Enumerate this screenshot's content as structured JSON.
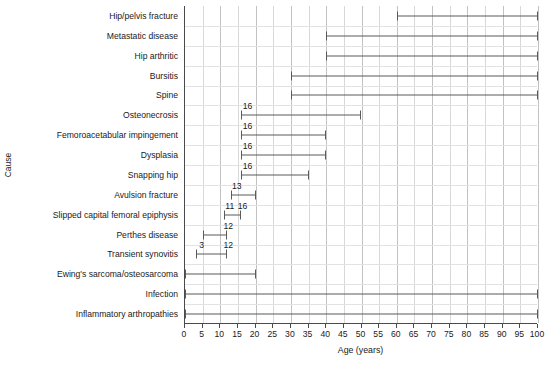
{
  "chart_data": {
    "type": "bar",
    "subtype": "range-bar",
    "title": "",
    "xlabel": "Age (years)",
    "ylabel": "Cause",
    "xlim": [
      0,
      100
    ],
    "xticks": [
      0,
      5,
      10,
      15,
      20,
      25,
      30,
      35,
      40,
      45,
      50,
      55,
      60,
      65,
      70,
      75,
      80,
      85,
      90,
      95,
      100
    ],
    "xtick_labels": [
      "0",
      "5",
      "10",
      "15",
      "20",
      "25",
      "30",
      "35",
      "40",
      "45",
      "50",
      "55",
      "60",
      "65",
      "70",
      "75",
      "80",
      "85",
      "90",
      "95",
      "100"
    ],
    "grid": true,
    "legend": false,
    "bar_color": "#5a5a5a",
    "categories": [
      "Hip/pelvis fracture",
      "Metastatic disease",
      "Hip arthritic",
      "Bursitis",
      "Spine",
      "Osteonecrosis",
      "Femoroacetabular impingement",
      "Dysplasia",
      "Snapping hip",
      "Avulsion fracture",
      "Slipped capital femoral epiphysis",
      "Perthes disease",
      "Transient synovitis",
      "Ewing's sarcoma/osteosarcoma",
      "Infection",
      "Inflammatory arthropathies"
    ],
    "ranges": [
      {
        "category": "Hip/pelvis fracture",
        "start": 60,
        "end": 100,
        "start_label": "",
        "end_label": ""
      },
      {
        "category": "Metastatic disease",
        "start": 40,
        "end": 100,
        "start_label": "",
        "end_label": ""
      },
      {
        "category": "Hip arthritic",
        "start": 40,
        "end": 100,
        "start_label": "",
        "end_label": ""
      },
      {
        "category": "Bursitis",
        "start": 30,
        "end": 100,
        "start_label": "",
        "end_label": ""
      },
      {
        "category": "Spine",
        "start": 30,
        "end": 100,
        "start_label": "",
        "end_label": ""
      },
      {
        "category": "Osteonecrosis",
        "start": 16,
        "end": 50,
        "start_label": "16",
        "end_label": ""
      },
      {
        "category": "Femoroacetabular impingement",
        "start": 16,
        "end": 40,
        "start_label": "16",
        "end_label": ""
      },
      {
        "category": "Dysplasia",
        "start": 16,
        "end": 40,
        "start_label": "16",
        "end_label": ""
      },
      {
        "category": "Snapping hip",
        "start": 16,
        "end": 35,
        "start_label": "16",
        "end_label": ""
      },
      {
        "category": "Avulsion fracture",
        "start": 13,
        "end": 20,
        "start_label": "13",
        "end_label": ""
      },
      {
        "category": "Slipped capital femoral epiphysis",
        "start": 11,
        "end": 16,
        "start_label": "11",
        "end_label": "16"
      },
      {
        "category": "Perthes disease",
        "start": 5,
        "end": 12,
        "start_label": "",
        "end_label": "12"
      },
      {
        "category": "Transient synovitis",
        "start": 3,
        "end": 12,
        "start_label": "3",
        "end_label": "12"
      },
      {
        "category": "Ewing's sarcoma/osteosarcoma",
        "start": 0,
        "end": 20,
        "start_label": "",
        "end_label": ""
      },
      {
        "category": "Infection",
        "start": 0,
        "end": 100,
        "start_label": "",
        "end_label": ""
      },
      {
        "category": "Inflammatory arthropathies",
        "start": 0,
        "end": 100,
        "start_label": "",
        "end_label": ""
      }
    ]
  }
}
